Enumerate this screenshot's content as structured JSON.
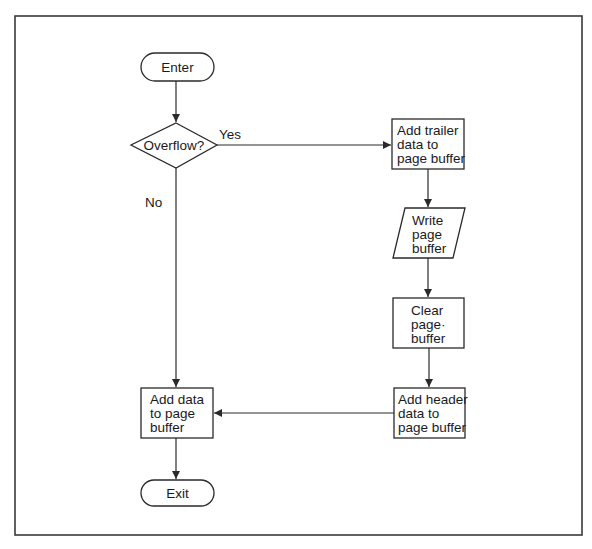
{
  "diagram": {
    "type": "flowchart",
    "colors": {
      "stroke": "#2a2a2a",
      "text": "#1a1a1a",
      "background": "#ffffff",
      "frame": "#3a3a3a"
    },
    "nodes": {
      "enter": {
        "shape": "terminal",
        "lines": [
          "Enter"
        ]
      },
      "overflow": {
        "shape": "decision",
        "lines": [
          "Overflow?"
        ]
      },
      "add_trailer": {
        "shape": "process",
        "lines": [
          "Add trailer",
          "data to",
          "page buffer"
        ]
      },
      "write_page": {
        "shape": "io-parallelogram",
        "lines": [
          "Write",
          "page",
          "buffer"
        ]
      },
      "clear_page": {
        "shape": "process",
        "lines": [
          "Clear",
          "page·",
          "buffer"
        ]
      },
      "add_header": {
        "shape": "process",
        "lines": [
          "Add header",
          "data to",
          "page buffer"
        ]
      },
      "add_data": {
        "shape": "process",
        "lines": [
          "Add data",
          "to page",
          "buffer"
        ]
      },
      "exit": {
        "shape": "terminal",
        "lines": [
          "Exit"
        ]
      }
    },
    "edges": [
      {
        "from": "enter",
        "to": "overflow",
        "label": ""
      },
      {
        "from": "overflow",
        "to": "add_trailer",
        "label": "Yes"
      },
      {
        "from": "overflow",
        "to": "add_data",
        "label": "No"
      },
      {
        "from": "add_trailer",
        "to": "write_page",
        "label": ""
      },
      {
        "from": "write_page",
        "to": "clear_page",
        "label": ""
      },
      {
        "from": "clear_page",
        "to": "add_header",
        "label": ""
      },
      {
        "from": "add_header",
        "to": "add_data",
        "label": ""
      },
      {
        "from": "add_data",
        "to": "exit",
        "label": ""
      }
    ],
    "labels": {
      "yes": "Yes",
      "no": "No"
    }
  }
}
